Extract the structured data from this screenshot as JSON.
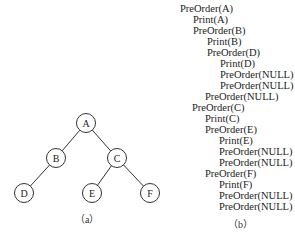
{
  "tree": {
    "nodes": [
      {
        "id": "A",
        "label": "A",
        "x": 86,
        "y": 123
      },
      {
        "id": "B",
        "label": "B",
        "x": 56,
        "y": 158
      },
      {
        "id": "C",
        "label": "C",
        "x": 117,
        "y": 158
      },
      {
        "id": "D",
        "label": "D",
        "x": 24,
        "y": 193
      },
      {
        "id": "E",
        "label": "E",
        "x": 92,
        "y": 193
      },
      {
        "id": "F",
        "label": "F",
        "x": 150,
        "y": 193
      }
    ],
    "edges": [
      [
        "A",
        "B"
      ],
      [
        "A",
        "C"
      ],
      [
        "B",
        "D"
      ],
      [
        "C",
        "E"
      ],
      [
        "C",
        "F"
      ]
    ],
    "radius": 9.5,
    "caption": "（a）"
  },
  "trace": {
    "lines": [
      {
        "text": "PreOrder(A)",
        "x": 180
      },
      {
        "text": "Print(A)",
        "x": 193
      },
      {
        "text": "PreOrder(B)",
        "x": 193
      },
      {
        "text": "Print(B)",
        "x": 207
      },
      {
        "text": "PreOrder(D)",
        "x": 207
      },
      {
        "text": "Print(D)",
        "x": 220
      },
      {
        "text": "PreOrder(NULL)",
        "x": 220
      },
      {
        "text": "PreOrder(NULL)",
        "x": 220
      },
      {
        "text": "PreOrder(NULL)",
        "x": 205
      },
      {
        "text": "PreOrder(C)",
        "x": 192
      },
      {
        "text": "Print(C)",
        "x": 205
      },
      {
        "text": "PreOrder(E)",
        "x": 205
      },
      {
        "text": "Print(E)",
        "x": 219
      },
      {
        "text": "PreOrder(NULL)",
        "x": 219
      },
      {
        "text": "PreOrder(NULL)",
        "x": 219
      },
      {
        "text": "PreOrder(F)",
        "x": 205
      },
      {
        "text": "Print(F)",
        "x": 219
      },
      {
        "text": "PreOrder(NULL)",
        "x": 219
      },
      {
        "text": "PreOrder(NULL)",
        "x": 219
      }
    ],
    "top": 3,
    "line_height": 11,
    "caption": "（b）"
  }
}
